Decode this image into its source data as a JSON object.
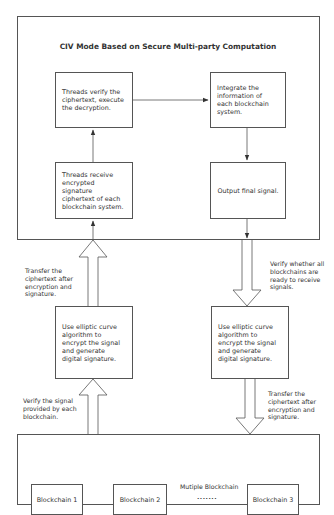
{
  "diagram": {
    "title": "CIV Mode Based on Secure Multi-party Computation",
    "top_boxes": {
      "threads_verify": "Threads verify the ciphertext, execute the decryption.",
      "integrate": "Integrate the information of each blockchain system.",
      "threads_receive": "Threads receive encrypted signature ciphertext of each blockchain system.",
      "output_signal": "Output final signal."
    },
    "middle_boxes": {
      "left_ecc": "Use elliptic curve algorithm to encrypt the signal and generate digital signature.",
      "right_ecc": "Use elliptic curve algorithm to encrypt the signal and generate digital signature."
    },
    "arrow_labels": {
      "left_upper": "Transfer the ciphertext after encryption and signature.",
      "right_upper": "Verify whether all blockchains are ready to receive signals.",
      "left_lower": "Verify the signal provided by each blockchain.",
      "right_lower": "Transfer the ciphertext after encryption and signature."
    },
    "bottom": {
      "group_label": "Mutiple Blockchain",
      "ellipsis": "•••••••",
      "chains": [
        "Blockchain 1",
        "Blockchain 2",
        "Blockchain 3"
      ]
    },
    "colors": {
      "stroke": "#555555",
      "text": "#333333",
      "background": "#ffffff"
    }
  }
}
